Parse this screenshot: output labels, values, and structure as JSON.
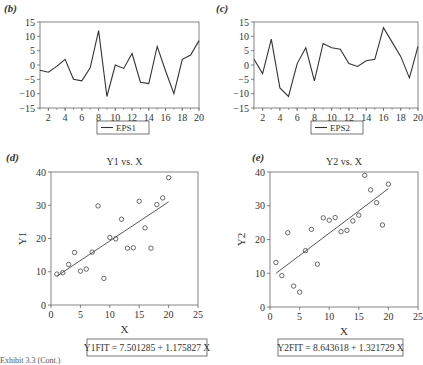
{
  "chart_data": [
    {
      "id": "b",
      "panel_label": "(b)",
      "type": "line",
      "title": "",
      "xlabel": "",
      "ylabel": "",
      "x": [
        1,
        2,
        3,
        4,
        5,
        6,
        7,
        8,
        9,
        10,
        11,
        12,
        13,
        14,
        15,
        16,
        17,
        18,
        19,
        20
      ],
      "series": [
        {
          "name": "EPS1",
          "values": [
            -1.8,
            -2.5,
            -0.5,
            2,
            -5,
            -5.5,
            -1,
            12,
            -11,
            0,
            -1.2,
            4,
            -6,
            -6.5,
            6.5,
            -2,
            -10,
            2,
            3.5,
            8.5
          ]
        }
      ],
      "xlim": [
        1,
        20
      ],
      "ylim": [
        -15,
        15
      ],
      "xticks": [
        2,
        4,
        6,
        8,
        10,
        12,
        14,
        16,
        18,
        20
      ],
      "yticks": [
        -15,
        -10,
        -5,
        0,
        5,
        10,
        15
      ],
      "legend": {
        "position": "bottom",
        "entries": [
          "EPS1"
        ]
      },
      "grid": false
    },
    {
      "id": "c",
      "panel_label": "(c)",
      "type": "line",
      "title": "",
      "xlabel": "",
      "ylabel": "",
      "x": [
        1,
        2,
        3,
        4,
        5,
        6,
        7,
        8,
        9,
        10,
        11,
        12,
        13,
        14,
        15,
        16,
        17,
        18,
        19,
        20
      ],
      "series": [
        {
          "name": "EPS2",
          "values": [
            2,
            -3,
            9,
            -8,
            -11,
            0.5,
            6,
            -5.5,
            7.5,
            6,
            5.5,
            0.5,
            -0.5,
            1.5,
            2,
            13,
            8,
            3,
            -4.5,
            6.5
          ]
        }
      ],
      "xlim": [
        1,
        20
      ],
      "ylim": [
        -15,
        15
      ],
      "xticks": [
        2,
        4,
        6,
        8,
        10,
        12,
        14,
        16,
        18,
        20
      ],
      "yticks": [
        -15,
        -10,
        -5,
        0,
        5,
        10,
        15
      ],
      "legend": {
        "position": "bottom",
        "entries": [
          "EPS2"
        ]
      },
      "grid": false
    },
    {
      "id": "d",
      "panel_label": "(d)",
      "type": "scatter",
      "title": "Y1 vs. X",
      "xlabel": "X",
      "ylabel": "Y1",
      "x": [
        1,
        2,
        3,
        4,
        5,
        6,
        7,
        8,
        9,
        10,
        11,
        12,
        13,
        14,
        15,
        16,
        17,
        18,
        19,
        20
      ],
      "series": [
        {
          "name": "Y1",
          "values": [
            9.3,
            9.7,
            12.2,
            15.8,
            10.2,
            10.8,
            15.9,
            29.8,
            8,
            20.3,
            19.9,
            25.8,
            17.1,
            17.2,
            31.2,
            23.2,
            17.1,
            30.2,
            32.2,
            38.3
          ]
        }
      ],
      "fit": {
        "intercept": 7.501285,
        "slope": 1.175827,
        "x_range": [
          1,
          20
        ]
      },
      "annotation": "Y1FIT = 7.501285 + 1.175827 X",
      "xlim": [
        0,
        25
      ],
      "ylim": [
        0,
        40
      ],
      "xticks": [
        0,
        5,
        10,
        15,
        20,
        25
      ],
      "yticks": [
        0,
        10,
        20,
        30,
        40
      ],
      "grid": false
    },
    {
      "id": "e",
      "panel_label": "(e)",
      "type": "scatter",
      "title": "Y2 vs. X",
      "xlabel": "X",
      "ylabel": "Y2",
      "x": [
        1,
        2,
        3,
        4,
        5,
        6,
        7,
        8,
        9,
        10,
        11,
        12,
        13,
        14,
        15,
        16,
        17,
        18,
        19,
        20
      ],
      "series": [
        {
          "name": "Y2",
          "values": [
            13.2,
            9.3,
            22,
            6.2,
            4.4,
            16.7,
            23,
            12.7,
            26.4,
            25.7,
            26.5,
            22.3,
            22.7,
            25.5,
            27.2,
            39,
            34.7,
            30.9,
            24.3,
            36.4
          ]
        }
      ],
      "fit": {
        "intercept": 8.643618,
        "slope": 1.321729,
        "x_range": [
          1,
          20
        ]
      },
      "annotation": "Y2FIT = 8.643618 + 1.321729 X",
      "xlim": [
        0,
        25
      ],
      "ylim": [
        0,
        40
      ],
      "xticks": [
        0,
        5,
        10,
        15,
        20,
        25
      ],
      "yticks": [
        0,
        10,
        20,
        30,
        40
      ],
      "grid": false
    }
  ],
  "footer_text": "Exhibit 3.3 (Cont.)"
}
